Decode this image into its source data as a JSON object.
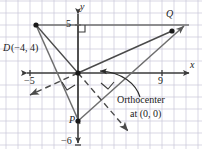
{
  "figure": {
    "type": "coordinate-plane-geometry-diagram",
    "colors": {
      "grid": "#c9c6d8",
      "axis": "#3a3a3a",
      "triangle": "#6e6e6e",
      "altitude": "#4a4a4a",
      "text": "#1a1a1a",
      "background": "#ffffff"
    },
    "axes": {
      "x_label": "x",
      "y_label": "y",
      "x_ticks": [
        {
          "label": "−5",
          "value": -5
        },
        {
          "label": "9",
          "value": 9
        }
      ],
      "y_ticks": [
        {
          "label": "5",
          "value": 5
        },
        {
          "label": "−6",
          "value": -6
        }
      ],
      "x_range": [
        -7,
        10
      ],
      "y_range": [
        -7,
        6
      ],
      "grid": true,
      "grid_step": 1
    },
    "points": [
      {
        "name": "D",
        "label": "D",
        "coords_label": "(−4, 4)",
        "x": -4,
        "y": 4
      },
      {
        "name": "Q",
        "label": "Q",
        "coords_label": "",
        "x": 7,
        "y": 4
      },
      {
        "name": "P",
        "label": "P",
        "coords_label": "",
        "x": 0,
        "y": -4
      }
    ],
    "annotation": {
      "line1": "Orthocenter",
      "line2": "at (0, 0)"
    },
    "right_angle_marks": 3
  }
}
